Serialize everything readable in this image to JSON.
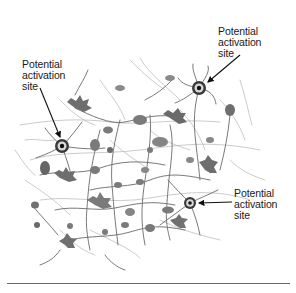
{
  "figure": {
    "palette": {
      "background": "#ffffff",
      "soma": "#7a7a7a",
      "soma_dark": "#5e5e5e",
      "dendrite": "#6f6f6f",
      "dendrite_light": "#a8a8a8",
      "marker_ring": "#d8d8d8",
      "marker_core": "#111111",
      "arrow": "#111111",
      "text": "#1a1a1a",
      "rule": "#6a6a6a"
    },
    "labels": [
      {
        "id": "top-right",
        "lines": [
          "Potential",
          "activation",
          "site"
        ]
      },
      {
        "id": "top-left",
        "lines": [
          "Potential",
          "activation",
          "site"
        ]
      },
      {
        "id": "bottom-right",
        "lines": [
          "Potential",
          "activation",
          "site"
        ]
      }
    ],
    "activation_sites": [
      {
        "id": "top-right",
        "cx": 199,
        "cy": 88
      },
      {
        "id": "top-left",
        "cx": 62,
        "cy": 146
      },
      {
        "id": "bottom-right",
        "cx": 190,
        "cy": 203
      }
    ]
  }
}
